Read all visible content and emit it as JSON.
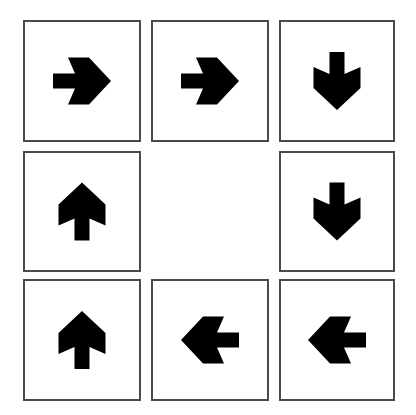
{
  "puzzle": {
    "colors": {
      "border": "#4a4a4a",
      "arrow": "#000000",
      "background": "#ffffff"
    },
    "cells": [
      {
        "row": 0,
        "col": 0,
        "icon": "arrow-right-icon",
        "direction": "right",
        "x": 23,
        "y": 20,
        "w": 118,
        "h": 122
      },
      {
        "row": 0,
        "col": 1,
        "icon": "arrow-right-icon",
        "direction": "right",
        "x": 151,
        "y": 20,
        "w": 118,
        "h": 122
      },
      {
        "row": 0,
        "col": 2,
        "icon": "arrow-down-icon",
        "direction": "down",
        "x": 279,
        "y": 20,
        "w": 116,
        "h": 122
      },
      {
        "row": 1,
        "col": 0,
        "icon": "arrow-up-icon",
        "direction": "up",
        "x": 23,
        "y": 151,
        "w": 118,
        "h": 121
      },
      {
        "row": 1,
        "col": 1,
        "icon": "",
        "direction": "empty",
        "x": 151,
        "y": 151,
        "w": 118,
        "h": 121
      },
      {
        "row": 1,
        "col": 2,
        "icon": "arrow-down-icon",
        "direction": "down",
        "x": 279,
        "y": 151,
        "w": 116,
        "h": 121
      },
      {
        "row": 2,
        "col": 0,
        "icon": "arrow-up-icon",
        "direction": "up",
        "x": 23,
        "y": 279,
        "w": 118,
        "h": 122
      },
      {
        "row": 2,
        "col": 1,
        "icon": "arrow-left-icon",
        "direction": "left",
        "x": 151,
        "y": 279,
        "w": 118,
        "h": 122
      },
      {
        "row": 2,
        "col": 2,
        "icon": "arrow-left-icon",
        "direction": "left",
        "x": 279,
        "y": 279,
        "w": 116,
        "h": 122
      }
    ]
  }
}
